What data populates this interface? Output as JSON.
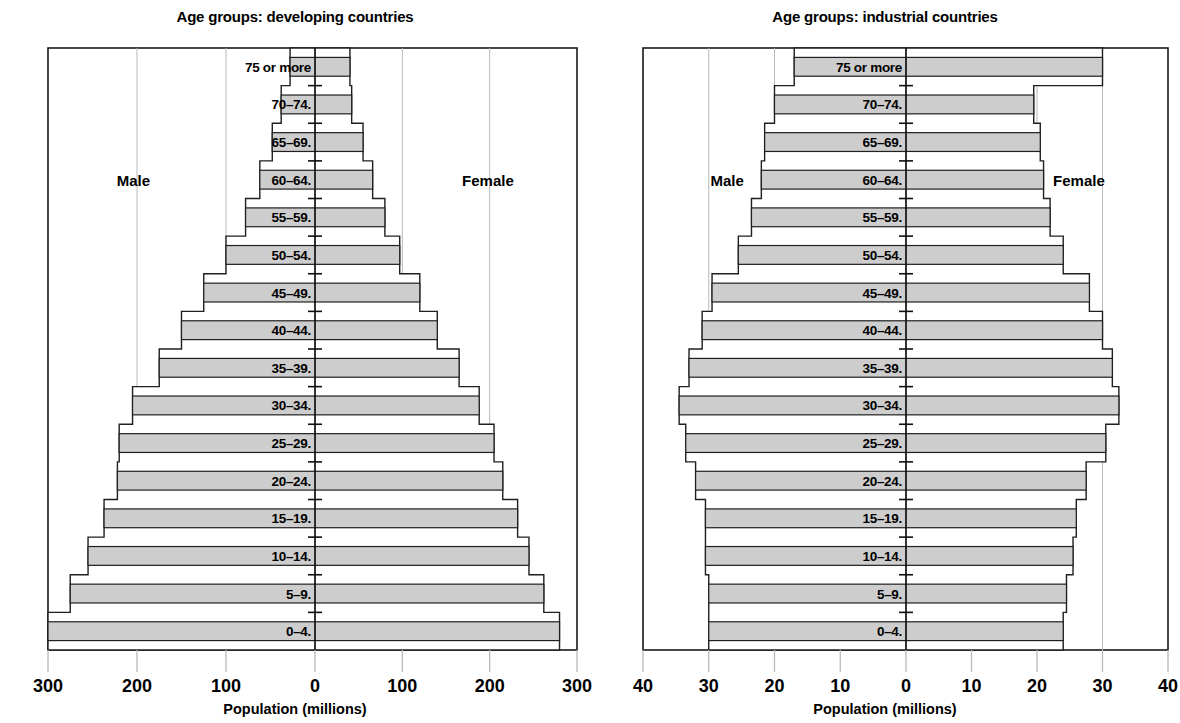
{
  "panels": [
    {
      "id": "developing",
      "title": "Age groups: developing countries",
      "xlabel": "Population (millions)",
      "male_label": "Male",
      "female_label": "Female",
      "ticks": [
        "300",
        "200",
        "100",
        "0",
        "100",
        "200",
        "300"
      ],
      "tick_values": [
        -300,
        -200,
        -100,
        0,
        100,
        200,
        300
      ],
      "xmax": 300
    },
    {
      "id": "industrial",
      "title": "Age groups: industrial countries",
      "xlabel": "Population (millions)",
      "male_label": "Male",
      "female_label": "Female",
      "ticks": [
        "40",
        "30",
        "20",
        "10",
        "0",
        "10",
        "20",
        "30",
        "40"
      ],
      "tick_values": [
        -40,
        -30,
        -20,
        -10,
        0,
        10,
        20,
        30,
        40
      ],
      "xmax": 40
    }
  ],
  "age_groups": [
    "0–4.",
    "5–9.",
    "10–14.",
    "15–19.",
    "20–24.",
    "25–29.",
    "30–34.",
    "35–39.",
    "40–44.",
    "45–49.",
    "50–54.",
    "55–59.",
    "60–64.",
    "65–69.",
    "70–74.",
    "75 or more"
  ],
  "chart_data": [
    {
      "type": "bar",
      "title": "Age groups: developing countries",
      "subtitle": "",
      "xlabel": "Population (millions)",
      "ylabel": "",
      "orientation": "horizontal",
      "layout": "population-pyramid",
      "grid": true,
      "legend": "none",
      "xlim": [
        -300,
        300
      ],
      "xticks": [
        -300,
        -200,
        -100,
        0,
        100,
        200,
        300
      ],
      "xticklabels": [
        "300",
        "200",
        "100",
        "0",
        "100",
        "200",
        "300"
      ],
      "categories": [
        "0–4.",
        "5–9.",
        "10–14.",
        "15–19.",
        "20–24.",
        "25–29.",
        "30–34.",
        "35–39.",
        "40–44.",
        "45–49.",
        "50–54.",
        "55–59.",
        "60–64.",
        "65–69.",
        "70–74.",
        "75 or more"
      ],
      "series": [
        {
          "name": "Male",
          "side": "left",
          "values": [
            300,
            275,
            255,
            237,
            222,
            220,
            205,
            175,
            150,
            125,
            100,
            78,
            62,
            48,
            38,
            28
          ]
        },
        {
          "name": "Female",
          "side": "right",
          "values": [
            280,
            262,
            245,
            232,
            215,
            205,
            188,
            165,
            140,
            120,
            97,
            80,
            66,
            55,
            42,
            40
          ]
        }
      ]
    },
    {
      "type": "bar",
      "title": "Age groups: industrial countries",
      "subtitle": "",
      "xlabel": "Population (millions)",
      "ylabel": "",
      "orientation": "horizontal",
      "layout": "population-pyramid",
      "grid": true,
      "legend": "none",
      "xlim": [
        -40,
        40
      ],
      "xticks": [
        -40,
        -30,
        -20,
        -10,
        0,
        10,
        20,
        30,
        40
      ],
      "xticklabels": [
        "40",
        "30",
        "20",
        "10",
        "0",
        "10",
        "20",
        "30",
        "40"
      ],
      "categories": [
        "0–4.",
        "5–9.",
        "10–14.",
        "15–19.",
        "20–24.",
        "25–29.",
        "30–34.",
        "35–39.",
        "40–44.",
        "45–49.",
        "50–54.",
        "55–59.",
        "60–64.",
        "65–69.",
        "70–74.",
        "75 or more"
      ],
      "series": [
        {
          "name": "Male",
          "side": "left",
          "values": [
            30,
            30,
            30.5,
            30.5,
            32,
            33.5,
            34.5,
            33,
            31,
            29.5,
            25.5,
            23.5,
            22,
            21.5,
            20,
            17
          ]
        },
        {
          "name": "Female",
          "side": "right",
          "values": [
            24,
            24.5,
            25.5,
            26,
            27.5,
            30.5,
            32.5,
            31.5,
            30,
            28,
            24,
            22,
            21,
            20.5,
            19.5,
            30
          ]
        }
      ]
    }
  ]
}
